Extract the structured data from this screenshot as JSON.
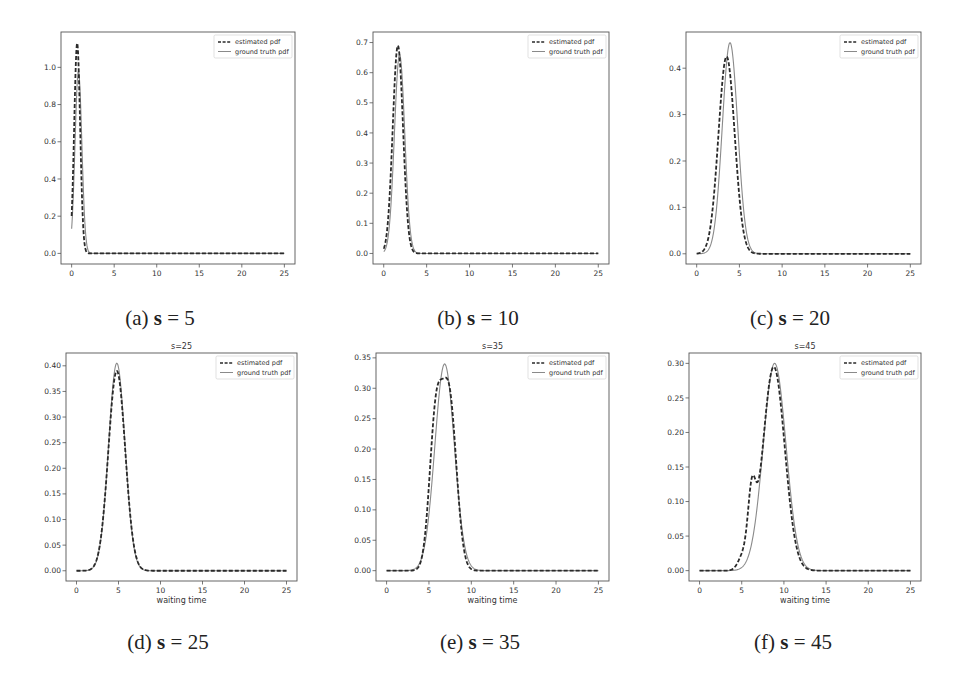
{
  "chart_data": [
    {
      "id": "a",
      "type": "line",
      "title": "",
      "caption": {
        "label": "(a)",
        "var": "s",
        "eq": "=",
        "value": "5"
      },
      "xlabel": "",
      "ylabel": "",
      "xlim": [
        -1.25,
        26.25
      ],
      "ylim": [
        -0.057,
        1.19
      ],
      "xticks": [
        0,
        5,
        10,
        15,
        20,
        25
      ],
      "yticks": [
        0.0,
        0.2,
        0.4,
        0.6,
        0.8,
        1.0
      ],
      "ytick_labels": [
        "0.0",
        "0.2",
        "0.4",
        "0.6",
        "0.8",
        "1.0"
      ],
      "legend": [
        "estimated pdf",
        "ground truth pdf"
      ],
      "legend_position": "upper right",
      "series": [
        {
          "name": "estimated pdf",
          "style": "dashed",
          "peaks": [
            {
              "mu": 0.65,
              "sigma": 0.35,
              "amp": 1.13
            }
          ],
          "start": 0.0
        },
        {
          "name": "ground truth pdf",
          "style": "solid",
          "peaks": [
            {
              "mu": 0.8,
              "sigma": 0.4,
              "amp": 0.98
            }
          ],
          "start": 0.0
        }
      ],
      "peak_values": {
        "estimated pdf": 1.13,
        "ground truth pdf": 0.98
      }
    },
    {
      "id": "b",
      "type": "line",
      "title": "",
      "caption": {
        "label": "(b)",
        "var": "s",
        "eq": "=",
        "value": "10"
      },
      "xlabel": "",
      "ylabel": "",
      "xlim": [
        -1.25,
        26.25
      ],
      "ylim": [
        -0.035,
        0.735
      ],
      "xticks": [
        0,
        5,
        10,
        15,
        20,
        25
      ],
      "yticks": [
        0.0,
        0.1,
        0.2,
        0.3,
        0.4,
        0.5,
        0.6,
        0.7
      ],
      "ytick_labels": [
        "0.0",
        "0.1",
        "0.2",
        "0.3",
        "0.4",
        "0.5",
        "0.6",
        "0.7"
      ],
      "legend": [
        "estimated pdf",
        "ground truth pdf"
      ],
      "legend_position": "upper right",
      "series": [
        {
          "name": "estimated pdf",
          "style": "dashed",
          "peaks": [
            {
              "mu": 1.65,
              "sigma": 0.6,
              "amp": 0.69
            }
          ],
          "start": 0.0
        },
        {
          "name": "ground truth pdf",
          "style": "solid",
          "peaks": [
            {
              "mu": 1.85,
              "sigma": 0.6,
              "amp": 0.66
            }
          ],
          "start": 0.0
        }
      ],
      "peak_values": {
        "estimated pdf": 0.69,
        "ground truth pdf": 0.66
      }
    },
    {
      "id": "c",
      "type": "line",
      "title": "",
      "caption": {
        "label": "(c)",
        "var": "s",
        "eq": "=",
        "value": "20"
      },
      "xlabel": "",
      "ylabel": "",
      "xlim": [
        -1.25,
        26.25
      ],
      "ylim": [
        -0.022,
        0.478
      ],
      "xticks": [
        0,
        5,
        10,
        15,
        20,
        25
      ],
      "yticks": [
        0.0,
        0.1,
        0.2,
        0.3,
        0.4
      ],
      "ytick_labels": [
        "0.0",
        "0.1",
        "0.2",
        "0.3",
        "0.4"
      ],
      "legend": [
        "estimated pdf",
        "ground truth pdf"
      ],
      "legend_position": "upper right",
      "series": [
        {
          "name": "estimated pdf",
          "style": "dashed",
          "peaks": [
            {
              "mu": 3.5,
              "sigma": 0.95,
              "amp": 0.425
            }
          ],
          "start": 0.0
        },
        {
          "name": "ground truth pdf",
          "style": "solid",
          "peaks": [
            {
              "mu": 3.9,
              "sigma": 0.9,
              "amp": 0.455
            }
          ],
          "start": 0.0
        }
      ],
      "peak_values": {
        "estimated pdf": 0.425,
        "ground truth pdf": 0.455
      }
    },
    {
      "id": "d",
      "type": "line",
      "title": "s=25",
      "caption": {
        "label": "(d)",
        "var": "s",
        "eq": "=",
        "value": "25"
      },
      "xlabel": "waiting time",
      "ylabel": "",
      "xlim": [
        -1.25,
        26.25
      ],
      "ylim": [
        -0.02,
        0.425
      ],
      "xticks": [
        0,
        5,
        10,
        15,
        20,
        25
      ],
      "yticks": [
        0.0,
        0.05,
        0.1,
        0.15,
        0.2,
        0.25,
        0.3,
        0.35,
        0.4
      ],
      "ytick_labels": [
        "0.00",
        "0.05",
        "0.10",
        "0.15",
        "0.20",
        "0.25",
        "0.30",
        "0.35",
        "0.40"
      ],
      "legend": [
        "estimated pdf",
        "ground truth pdf"
      ],
      "legend_position": "upper right",
      "series": [
        {
          "name": "estimated pdf",
          "style": "dashed",
          "peaks": [
            {
              "mu": 4.8,
              "sigma": 1.0,
              "amp": 0.39
            }
          ],
          "start": 0.0
        },
        {
          "name": "ground truth pdf",
          "style": "solid",
          "peaks": [
            {
              "mu": 4.8,
              "sigma": 0.98,
              "amp": 0.405
            }
          ],
          "start": 0.0
        }
      ],
      "peak_values": {
        "estimated pdf": 0.39,
        "ground truth pdf": 0.405
      }
    },
    {
      "id": "e",
      "type": "line",
      "title": "s=35",
      "caption": {
        "label": "(e)",
        "var": "s",
        "eq": "=",
        "value": "35"
      },
      "xlabel": "waiting time",
      "ylabel": "",
      "xlim": [
        -1.25,
        26.25
      ],
      "ylim": [
        -0.017,
        0.358
      ],
      "xticks": [
        0,
        5,
        10,
        15,
        20,
        25
      ],
      "yticks": [
        0.0,
        0.05,
        0.1,
        0.15,
        0.2,
        0.25,
        0.3,
        0.35
      ],
      "ytick_labels": [
        "0.00",
        "0.05",
        "0.10",
        "0.15",
        "0.20",
        "0.25",
        "0.30",
        "0.35"
      ],
      "legend": [
        "estimated pdf",
        "ground truth pdf"
      ],
      "legend_position": "upper right",
      "series": [
        {
          "name": "estimated pdf",
          "style": "dashed",
          "peaks": [
            {
              "mu": 5.8,
              "sigma": 0.75,
              "amp": 0.24
            },
            {
              "mu": 7.4,
              "sigma": 0.85,
              "amp": 0.28
            }
          ],
          "start": 0.0
        },
        {
          "name": "ground truth pdf",
          "style": "solid",
          "peaks": [
            {
              "mu": 6.85,
              "sigma": 1.15,
              "amp": 0.34
            }
          ],
          "start": 0.0
        }
      ],
      "peak_values": {
        "estimated pdf": 0.295,
        "ground truth pdf": 0.34
      }
    },
    {
      "id": "f",
      "type": "line",
      "title": "s=45",
      "caption": {
        "label": "(f)",
        "var": "s",
        "eq": "=",
        "value": "45"
      },
      "xlabel": "waiting time",
      "ylabel": "",
      "xlim": [
        -1.25,
        26.25
      ],
      "ylim": [
        -0.015,
        0.315
      ],
      "xticks": [
        0,
        5,
        10,
        15,
        20,
        25
      ],
      "yticks": [
        0.0,
        0.05,
        0.1,
        0.15,
        0.2,
        0.25,
        0.3
      ],
      "ytick_labels": [
        "0.00",
        "0.05",
        "0.10",
        "0.15",
        "0.20",
        "0.25",
        "0.30"
      ],
      "legend": [
        "estimated pdf",
        "ground truth pdf"
      ],
      "legend_position": "upper right",
      "series": [
        {
          "name": "estimated pdf",
          "style": "dashed",
          "peaks": [
            {
              "mu": 6.2,
              "sigma": 0.45,
              "amp": 0.09
            },
            {
              "mu": 8.8,
              "sigma": 1.3,
              "amp": 0.295
            },
            {
              "mu": 5.2,
              "sigma": 0.6,
              "amp": 0.02
            }
          ],
          "start": 0.0
        },
        {
          "name": "ground truth pdf",
          "style": "solid",
          "peaks": [
            {
              "mu": 8.9,
              "sigma": 1.35,
              "amp": 0.3
            }
          ],
          "start": 0.0
        }
      ],
      "peak_values": {
        "estimated pdf": 0.295,
        "ground truth pdf": 0.3
      }
    }
  ],
  "layout": {
    "panels": [
      {
        "id": "a",
        "axes": [
          61,
          32,
          295,
          264
        ],
        "caption_center": [
          160,
          319
        ]
      },
      {
        "id": "b",
        "axes": [
          373,
          32,
          609,
          264
        ],
        "caption_center": [
          478,
          319
        ]
      },
      {
        "id": "c",
        "axes": [
          686,
          32,
          921,
          264
        ],
        "caption_center": [
          790,
          319
        ]
      },
      {
        "id": "d",
        "axes": [
          66,
          353,
          297,
          581
        ],
        "caption_center": [
          168,
          643
        ]
      },
      {
        "id": "e",
        "axes": [
          376,
          353,
          609,
          581
        ],
        "caption_center": [
          480,
          643
        ]
      },
      {
        "id": "f",
        "axes": [
          689,
          353,
          921,
          581
        ],
        "caption_center": [
          793,
          643
        ]
      }
    ]
  },
  "colors": {
    "estimated": "#2a2a2a",
    "ground_truth": "#8a8a8a",
    "axes": "#555555",
    "text": "#333333"
  }
}
